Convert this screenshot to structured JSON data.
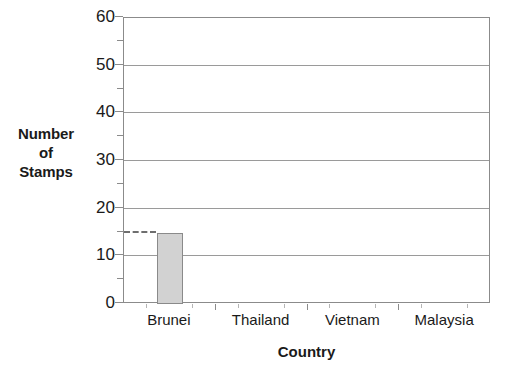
{
  "chart_data": {
    "type": "bar",
    "title": "",
    "xlabel": "Country",
    "ylabel_lines": [
      "Number",
      "of",
      "Stamps"
    ],
    "ylabel": "Number of Stamps",
    "categories": [
      "Brunei",
      "Thailand",
      "Vietnam",
      "Malaysia"
    ],
    "values": [
      15,
      0,
      0,
      0
    ],
    "ylim": [
      0,
      60
    ],
    "y_major_ticks": [
      0,
      10,
      20,
      30,
      40,
      50,
      60
    ],
    "y_minor_ticks": [
      5,
      15,
      25,
      35,
      45,
      55
    ],
    "y_tick_labels": [
      "0",
      "10",
      "20",
      "30",
      "40",
      "50",
      "60"
    ],
    "grid": "horizontal-major",
    "legend": "none",
    "annotations": [
      {
        "type": "dashed-guide",
        "value": 15,
        "category": "Brunei",
        "note": "dashed leader line from y-axis at 15 to the top of the Brunei bar"
      }
    ],
    "colors": {
      "bar_fill": "#d2d2d2",
      "bar_border": "#8a8a8a",
      "axis": "#8b8b8b",
      "grid": "#9a9a9a",
      "text": "#1a1a1a",
      "background": "#ffffff"
    }
  }
}
